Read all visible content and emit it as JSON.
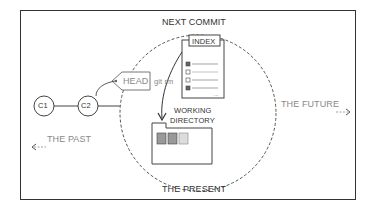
{
  "diagram": {
    "type": "git-concept",
    "labels": {
      "next_commit": "NEXT COMMIT",
      "index": "INDEX",
      "head": "HEAD",
      "git_rm": "git rm",
      "c1": "C1",
      "c2": "C2",
      "working_directory_line1": "WORKING",
      "working_directory_line2": "DIRECTORY",
      "the_past": "THE PAST",
      "the_future": "THE FUTURE",
      "the_present": "THE PRESENT"
    },
    "arrows": {
      "past_arrow": "<---",
      "future_arrow": "--->"
    },
    "colors": {
      "line": "#333333",
      "muted_text": "#888888",
      "background": "#ffffff"
    }
  }
}
